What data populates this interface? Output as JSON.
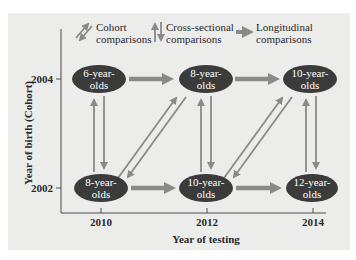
{
  "legend": {
    "cohort": {
      "line1": "Cohort",
      "line2": "comparisons"
    },
    "cross_sectional": {
      "line1": "Cross-sectional",
      "line2": "comparisons"
    },
    "longitudinal": {
      "line1": "Longitudinal",
      "line2": "comparisons"
    }
  },
  "axes": {
    "y_label": "Year of birth (Cohort)",
    "x_label": "Year of testing",
    "y_ticks": [
      "2004",
      "2002"
    ],
    "x_ticks": [
      "2010",
      "2012",
      "2014"
    ]
  },
  "nodes": {
    "top": [
      {
        "line1": "6-year-",
        "line2": "olds"
      },
      {
        "line1": "8-year-",
        "line2": "olds"
      },
      {
        "line1": "10-year-",
        "line2": "olds"
      }
    ],
    "bottom": [
      {
        "line1": "8-year-",
        "line2": "olds"
      },
      {
        "line1": "10-year-",
        "line2": "olds"
      },
      {
        "line1": "12-year-",
        "line2": "olds"
      }
    ]
  },
  "colors": {
    "panel": "#ececea",
    "node_fill": "#3b3b3b",
    "arrow": "#8a8a8a",
    "axis": "#4a4a4a",
    "text": "#2a2a2a"
  }
}
